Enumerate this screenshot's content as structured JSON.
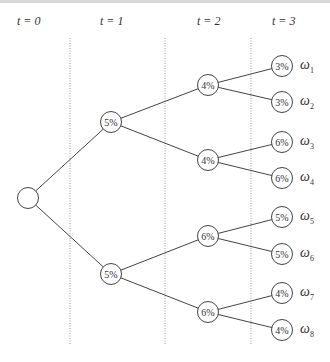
{
  "time_labels": [
    "t = 0",
    "t = 1",
    "t = 2",
    "t = 3"
  ],
  "nodes": {
    "root": "",
    "t1": [
      "5%",
      "5%"
    ],
    "t2": [
      "4%",
      "4%",
      "6%",
      "6%"
    ],
    "t3": [
      "3%",
      "3%",
      "6%",
      "6%",
      "5%",
      "5%",
      "4%",
      "4%"
    ]
  },
  "outcomes": [
    {
      "sym": "ω",
      "sub": "1"
    },
    {
      "sym": "ω",
      "sub": "2"
    },
    {
      "sym": "ω",
      "sub": "3"
    },
    {
      "sym": "ω",
      "sub": "4"
    },
    {
      "sym": "ω",
      "sub": "5"
    },
    {
      "sym": "ω",
      "sub": "6"
    },
    {
      "sym": "ω",
      "sub": "7"
    },
    {
      "sym": "ω",
      "sub": "8"
    }
  ]
}
